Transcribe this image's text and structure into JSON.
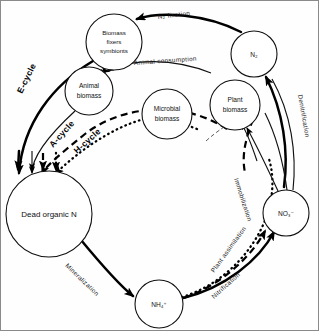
{
  "diagram": {
    "type": "cycle-diagram",
    "border_color": "#8a8a8a",
    "background": "#ffffff"
  },
  "nodes": [
    {
      "id": "biomass_fixers",
      "label_lines": [
        "Biomass",
        "fixers",
        "symbionts"
      ],
      "cx": 113,
      "cy": 41,
      "r": 28
    },
    {
      "id": "n2",
      "label_lines": [
        "N₂"
      ],
      "cx": 253,
      "cy": 53,
      "r": 23
    },
    {
      "id": "animal_biomass",
      "label_lines": [
        "Animal",
        "biomass"
      ],
      "cx": 88,
      "cy": 90,
      "r": 24
    },
    {
      "id": "plant_biomass",
      "label_lines": [
        "Plant",
        "biomass"
      ],
      "cx": 234,
      "cy": 104,
      "r": 25
    },
    {
      "id": "microbial",
      "label_lines": [
        "Microbial",
        "biomass"
      ],
      "cx": 166,
      "cy": 113,
      "r": 25
    },
    {
      "id": "dead_organic_n",
      "label_lines": [
        "Dead organic N"
      ],
      "cx": 48,
      "cy": 213,
      "r": 43
    },
    {
      "id": "no3",
      "label_lines": [
        "NO₃⁻"
      ],
      "cx": 285,
      "cy": 212,
      "r": 23
    },
    {
      "id": "nh4",
      "label_lines": [
        "NH₄⁺"
      ],
      "cx": 158,
      "cy": 303,
      "r": 24
    }
  ],
  "flow_labels": [
    {
      "id": "n2_fixation",
      "text": "N₂  fixation"
    },
    {
      "id": "animal_consumption",
      "text": "Animal  consumption"
    },
    {
      "id": "denitrification",
      "text": "Denitrification"
    },
    {
      "id": "immobilization",
      "text": "Immobilization"
    },
    {
      "id": "plant_assimilation",
      "text": "Plant  assimilation"
    },
    {
      "id": "nitrification",
      "text": "Nitrification"
    },
    {
      "id": "mineralization",
      "text": "Mineralization"
    }
  ],
  "cycle_labels": [
    {
      "id": "e_cycle",
      "text": "E-cycle",
      "style": "thick-solid"
    },
    {
      "id": "a_cycle",
      "text": "A-cycle",
      "style": "dashed"
    },
    {
      "id": "h_cycle",
      "text": "H-cycle",
      "style": "dotted"
    }
  ]
}
